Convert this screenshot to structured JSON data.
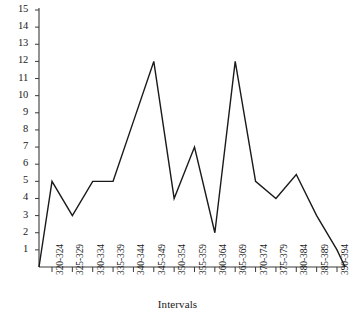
{
  "chart_data": {
    "type": "line",
    "title": "",
    "subtitle": "",
    "xlabel": "Intervals",
    "ylabel": "",
    "categories": [
      "320-324",
      "325-329",
      "330-334",
      "335-339",
      "340-344",
      "345-349",
      "350-354",
      "355-359",
      "360-364",
      "365-369",
      "370-374",
      "375-379",
      "380-384",
      "385-389",
      "390-394"
    ],
    "values": [
      5,
      3,
      5,
      5,
      8.5,
      12,
      4,
      7,
      2,
      12,
      5,
      4,
      5.4,
      3,
      1
    ],
    "leading_zero_anchor": 0,
    "trailing_zero_anchor": 0,
    "ylim": [
      0,
      15
    ],
    "yticks": [
      1,
      2,
      3,
      4,
      5,
      6,
      7,
      8,
      9,
      10,
      11,
      12,
      13,
      14,
      15
    ],
    "ytick_labels": [
      "1",
      "2",
      "3",
      "4",
      "5",
      "6",
      "7",
      "8",
      "9",
      "10",
      "11",
      "12",
      "13",
      "14",
      "15"
    ],
    "grid": false,
    "legend": "none",
    "line_color": "#1a1a1a",
    "axis_color": "#3a3a3a",
    "background": "#ffffff"
  }
}
